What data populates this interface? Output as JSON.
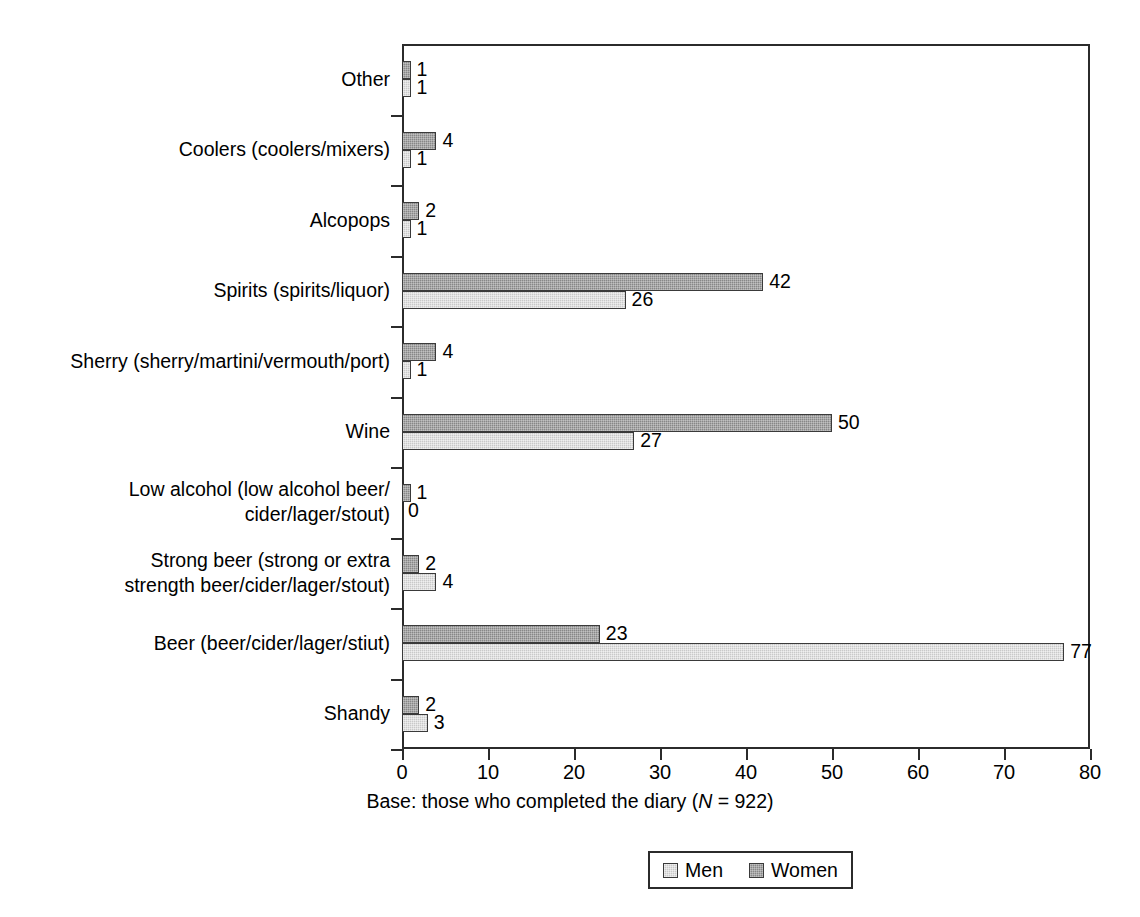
{
  "chart_data": {
    "type": "bar",
    "orientation": "horizontal",
    "title": "",
    "xlabel": "Base: those who completed the diary (N = 922)",
    "ylabel": "",
    "xlim": [
      0,
      80
    ],
    "xticks": [
      0,
      10,
      20,
      30,
      40,
      50,
      60,
      70,
      80
    ],
    "xtick_labels": [
      "0",
      "10",
      "20",
      "30",
      "40",
      "50",
      "60",
      "70",
      "80"
    ],
    "grid": false,
    "legend_position": "bottom-center",
    "categories": [
      "Shandy",
      "Beer (beer/cider/lager/stiut)",
      "Strong beer (strong or extra\nstrength beer/cider/lager/stout)",
      "Low alcohol (low alcohol beer/\ncider/lager/stout)",
      "Wine",
      "Sherry (sherry/martini/vermouth/port)",
      "Spirits (spirits/liquor)",
      "Alcopops",
      "Coolers (coolers/mixers)",
      "Other"
    ],
    "series": [
      {
        "name": "Men",
        "color": "#c9c9c9",
        "values": [
          3,
          77,
          4,
          0,
          27,
          1,
          26,
          1,
          1,
          1
        ]
      },
      {
        "name": "Women",
        "color": "#878787",
        "values": [
          2,
          23,
          2,
          1,
          50,
          4,
          42,
          2,
          4,
          1
        ]
      }
    ]
  },
  "axis": {
    "caption_prefix": "Base: those who completed the diary (",
    "caption_italic": "N",
    "caption_suffix": " = 922)"
  },
  "legend": {
    "entries": [
      {
        "label": "Men"
      },
      {
        "label": "Women"
      }
    ]
  }
}
